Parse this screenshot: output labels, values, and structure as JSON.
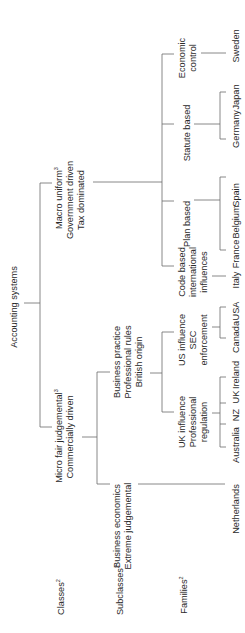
{
  "root": {
    "label": "Accounting systems"
  },
  "row_labels": {
    "classes": {
      "text": "Classes",
      "sup": "2"
    },
    "subclasses": {
      "text": "Subclasses",
      "sup": "2"
    },
    "families": {
      "text": "Families",
      "sup": "2"
    }
  },
  "classes": {
    "macro": {
      "lines": [
        "Macro uniform",
        "Government driven",
        "Tax dominated"
      ],
      "sup": "3"
    },
    "micro": {
      "lines": [
        "Micro fair judgemental",
        "Commercially driven"
      ],
      "sup": "3"
    }
  },
  "subclasses": {
    "business_practice": {
      "lines": [
        "Business practice",
        "Professional rules",
        "British origin"
      ]
    },
    "business_economics": {
      "lines": [
        "Business economics",
        "Extreme judgemental"
      ]
    }
  },
  "families": {
    "us_influence": {
      "lines": [
        "US influence",
        "SEC",
        "enforcement"
      ]
    },
    "uk_influence": {
      "lines": [
        "UK influence",
        "Professional",
        "regulation"
      ]
    },
    "code_based": {
      "lines": [
        "Code based",
        "international",
        "influences"
      ]
    },
    "plan_based": {
      "lines": [
        "Plan based"
      ]
    },
    "statute_based": {
      "lines": [
        "Statute based"
      ]
    },
    "economic_control": {
      "lines": [
        "Economic",
        "control"
      ]
    }
  },
  "countries": {
    "usa": "USA",
    "canada": "Canada",
    "ireland": "Ireland",
    "uk": "UK",
    "nz": "NZ",
    "australia": "Australia",
    "netherlands": "Netherlands",
    "italy": "Italy",
    "france": "France",
    "belgium": "Belgium",
    "spain": "Spain",
    "germany": "Germany",
    "japan": "Japan",
    "sweden": "Sweden"
  }
}
